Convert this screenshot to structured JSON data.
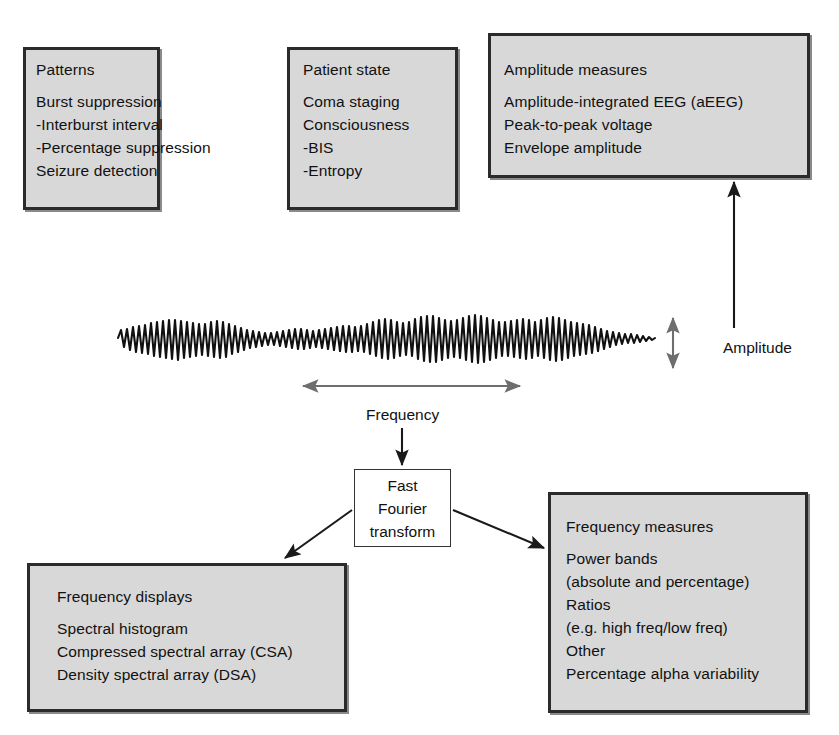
{
  "diagram": {
    "colors": {
      "box_fill": "#d8d8d8",
      "box_border": "#2b2b2b",
      "arrow_dark": "#1a1a1a",
      "arrow_gray": "#6e6e6e",
      "background": "#ffffff",
      "text": "#111111"
    },
    "boxes": {
      "patterns": {
        "heading": "Patterns",
        "items": [
          "Burst suppression",
          "-Interburst interval",
          "-Percentage suppression",
          "Seizure detection"
        ]
      },
      "patient_state": {
        "heading": "Patient state",
        "items": [
          "Coma staging",
          "Consciousness",
          "-BIS",
          "-Entropy"
        ]
      },
      "amplitude_measures": {
        "heading": "Amplitude measures",
        "items": [
          "Amplitude-integrated EEG (aEEG)",
          "Peak-to-peak voltage",
          "Envelope amplitude"
        ]
      },
      "frequency_displays": {
        "heading": "Frequency displays",
        "items": [
          "Spectral histogram",
          "Compressed spectral array (CSA)",
          "Density spectral array (DSA)"
        ]
      },
      "frequency_measures": {
        "heading": "Frequency measures",
        "items": [
          "Power bands",
          " (absolute and percentage)",
          "Ratios",
          " (e.g. high freq/low freq)",
          "Other",
          " Percentage alpha variability"
        ]
      },
      "fft": {
        "lines": [
          "Fast",
          "Fourier",
          "transform"
        ]
      }
    },
    "labels": {
      "amplitude": "Amplitude",
      "frequency": "Frequency"
    },
    "signal": {
      "name": "eeg-waveform",
      "description": "raw EEG trace"
    }
  }
}
